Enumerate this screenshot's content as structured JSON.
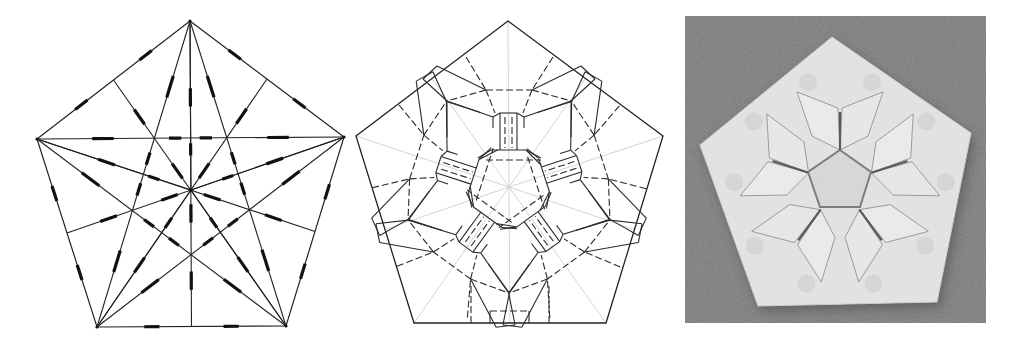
{
  "figure": {
    "panels": [
      {
        "id": "crease-pattern-base",
        "kind": "crease pattern",
        "shape": "regular pentagon",
        "vertices": [
          [
            190,
            21
          ],
          [
            344,
            137
          ],
          [
            286,
            326
          ],
          [
            97,
            327
          ],
          [
            37,
            139
          ]
        ],
        "center": [
          191,
          190
        ],
        "line_color": "#222222",
        "mark_style": "thick dashes (valley/mountain markers)"
      },
      {
        "id": "crease-pattern-detailed",
        "kind": "crease pattern",
        "shape": "regular pentagon",
        "vertices": [
          [
            508,
            21
          ],
          [
            663,
            136
          ],
          [
            606,
            323
          ],
          [
            414,
            323
          ],
          [
            356,
            136
          ]
        ],
        "center": [
          509,
          187
        ],
        "line_color": "#222222",
        "guide_color": "#cfcfcf",
        "line_styles": [
          "solid (mountain)",
          "dashed (valley)",
          "light gray (reference)"
        ]
      },
      {
        "id": "folded-model-photo",
        "kind": "photograph",
        "subject": "folded origami pentagon with pentagonal center",
        "frame": {
          "x": 685,
          "y": 16,
          "width": 301,
          "height": 307
        },
        "background_color": "#7b7b7b",
        "paper_color": "#e4e4e4",
        "outline": [
          [
            832,
            37
          ],
          [
            971,
            133
          ],
          [
            937,
            302
          ],
          [
            758,
            306
          ],
          [
            700,
            145
          ]
        ],
        "center": [
          840,
          183
        ]
      }
    ]
  }
}
